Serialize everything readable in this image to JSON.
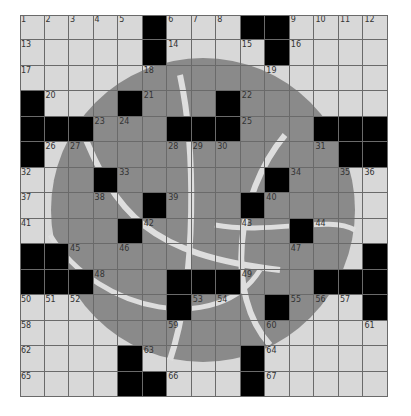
{
  "puzzle": {
    "rows": 15,
    "cols": 15,
    "theme_image": "basketball",
    "colors": {
      "cell": "#d8d8d8",
      "ball": "#8a8a8a",
      "seam": "#dedede",
      "block": "#000000",
      "gridline": "#6a6a6a"
    },
    "grid": [
      [
        "1",
        "2",
        "3",
        "4",
        "5",
        "#",
        "6",
        "7",
        "8",
        "#",
        "#",
        "9",
        "10",
        "11",
        "12"
      ],
      [
        "13",
        ".",
        ".",
        ".",
        ".",
        "#",
        "14",
        ".",
        ".",
        "15",
        "#",
        "16",
        ".",
        ".",
        "."
      ],
      [
        "17",
        ".",
        ".",
        ".",
        ".",
        "18",
        ".",
        ".",
        ".",
        ".",
        "19",
        ".",
        ".",
        ".",
        "."
      ],
      [
        "#",
        "20",
        ".",
        ".",
        "#",
        "21",
        ".",
        ".",
        "#",
        "22",
        ".",
        ".",
        ".",
        ".",
        "."
      ],
      [
        "#",
        "#",
        "#",
        "23",
        "24",
        ".",
        "#",
        "#",
        "#",
        "25",
        ".",
        ".",
        "#",
        "#",
        "#"
      ],
      [
        "#",
        "26",
        "27",
        ".",
        ".",
        ".",
        "28",
        "29",
        "30",
        ".",
        ".",
        ".",
        "31",
        "#",
        "#"
      ],
      [
        "32",
        ".",
        ".",
        "#",
        "33",
        ".",
        ".",
        ".",
        ".",
        ".",
        "#",
        "34",
        ".",
        "35",
        "36"
      ],
      [
        "37",
        ".",
        ".",
        "38",
        ".",
        "#",
        "39",
        ".",
        ".",
        "#",
        "40",
        ".",
        ".",
        ".",
        "."
      ],
      [
        "41",
        ".",
        ".",
        ".",
        "#",
        "42",
        ".",
        ".",
        ".",
        "43",
        ".",
        "#",
        "44",
        ".",
        "."
      ],
      [
        "#",
        "#",
        "45",
        ".",
        "46",
        ".",
        ".",
        ".",
        ".",
        ".",
        ".",
        "47",
        ".",
        ".",
        "#"
      ],
      [
        "#",
        "#",
        "#",
        "48",
        ".",
        ".",
        "#",
        "#",
        "#",
        "49",
        ".",
        ".",
        "#",
        "#",
        "#"
      ],
      [
        "50",
        "51",
        "52",
        ".",
        ".",
        ".",
        "#",
        "53",
        "54",
        ".",
        "#",
        "55",
        "56",
        "57",
        "#"
      ],
      [
        "58",
        ".",
        ".",
        ".",
        ".",
        ".",
        "59",
        ".",
        ".",
        ".",
        "60",
        ".",
        ".",
        ".",
        "61"
      ],
      [
        "62",
        ".",
        ".",
        ".",
        "#",
        "63",
        ".",
        ".",
        ".",
        "#",
        "64",
        ".",
        ".",
        ".",
        "."
      ],
      [
        "65",
        ".",
        ".",
        ".",
        "#",
        "#",
        "66",
        ".",
        ".",
        "#",
        "67",
        ".",
        ".",
        ".",
        "."
      ]
    ]
  }
}
